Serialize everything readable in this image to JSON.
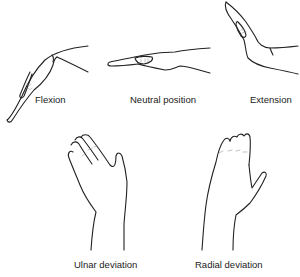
{
  "figure": {
    "panels": [
      {
        "id": "flexion",
        "label": "Flexion"
      },
      {
        "id": "neutral",
        "label": "Neutral position"
      },
      {
        "id": "extension",
        "label": "Extension"
      },
      {
        "id": "ulnar",
        "label": "Ulnar deviation"
      },
      {
        "id": "radial",
        "label": "Radial deviation"
      }
    ]
  },
  "colors": {
    "line": "#222222",
    "background": "#ffffff"
  }
}
